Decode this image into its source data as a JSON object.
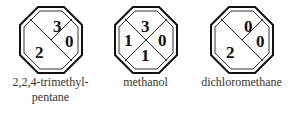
{
  "figure": {
    "type": "solvent-hazard-diamonds",
    "items": [
      {
        "name": "2,2,4-trimethylpentane",
        "label_lines": [
          "2,2,4-trimethyl-",
          "pentane"
        ],
        "layout": "single-diagonal",
        "values": {
          "top": "3",
          "right": "0",
          "bottom_left": "2"
        }
      },
      {
        "name": "methanol",
        "label_lines": [
          "methanol"
        ],
        "layout": "cross",
        "values": {
          "top": "3",
          "left": "1",
          "right": "0",
          "bottom": "1"
        }
      },
      {
        "name": "dichloromethane",
        "label_lines": [
          "dichloromethane"
        ],
        "layout": "single-diagonal",
        "values": {
          "top": "0",
          "right": "0",
          "bottom_left": "2"
        }
      }
    ]
  }
}
